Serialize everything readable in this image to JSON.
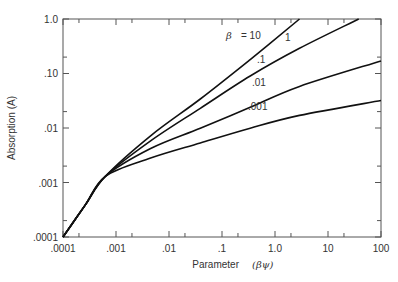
{
  "chart_data": {
    "type": "line",
    "title": "",
    "xlabel": "Parameter",
    "xlabel_symbol": "(βψ)",
    "ylabel": "Absorption (A)",
    "xscale": "log",
    "yscale": "log",
    "xlim": [
      0.0001,
      100
    ],
    "ylim": [
      0.0001,
      1.0
    ],
    "grid": false,
    "x_tick_labels": [
      ".0001",
      ".001",
      ".01",
      ".1",
      "1.0",
      "10",
      "100"
    ],
    "y_tick_labels": [
      "1.0",
      ".10",
      ".01",
      ".001",
      ".0001"
    ],
    "annotations": [
      "β",
      "= 10",
      "1",
      ".1",
      ".01",
      ".001"
    ],
    "series": [
      {
        "name": "β = 10",
        "x": [
          0.0001,
          0.00026,
          0.00063,
          0.0045,
          0.039,
          0.34,
          2.9
        ],
        "y": [
          0.0001,
          0.00038,
          0.0013,
          0.0072,
          0.034,
          0.18,
          1.0
        ]
      },
      {
        "name": "1",
        "x": [
          0.0001,
          0.00026,
          0.00063,
          0.0045,
          0.039,
          0.34,
          2.9,
          38
        ],
        "y": [
          0.0001,
          0.00038,
          0.0013,
          0.0058,
          0.023,
          0.09,
          0.29,
          1.0
        ]
      },
      {
        "name": ".1",
        "x": [
          0.0001,
          0.00026,
          0.00063,
          0.0045,
          0.039,
          0.34,
          2.9,
          100
        ],
        "y": [
          0.0001,
          0.00038,
          0.0013,
          0.0042,
          0.0099,
          0.024,
          0.058,
          0.17
        ]
      },
      {
        "name": ".01",
        "x": [
          0.0001,
          0.00026,
          0.00063,
          0.0045,
          0.039,
          0.34,
          2.9,
          100
        ],
        "y": [
          0.0001,
          0.00038,
          0.0013,
          0.0028,
          0.0053,
          0.0099,
          0.017,
          0.032
        ]
      }
    ]
  },
  "axes": {
    "y_title": "Absorption (A)",
    "x_title": "Parameter",
    "x_title_symbol": "(βψ)"
  },
  "labels": {
    "beta": "β",
    "eq10": "= 10",
    "one": "1",
    "p1": ".1",
    "p01": ".01",
    "p001": ".001"
  },
  "ticks": {
    "x": [
      ".0001",
      ".001",
      ".01",
      ".1",
      "1.0",
      "10",
      "100"
    ],
    "y": [
      "1.0",
      ".10",
      ".01",
      ".001",
      ".0001"
    ]
  }
}
